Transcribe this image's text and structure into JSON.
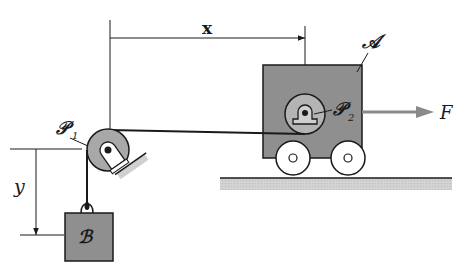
{
  "diagram": {
    "labels": {
      "x": "x",
      "y": "y",
      "force": "F",
      "cart": "𝒜",
      "block": "ℬ",
      "pulley1": "𝒫",
      "pulley1_sub": "1",
      "pulley2": "𝒫",
      "pulley2_sub": "2"
    },
    "colors": {
      "ink": "#1a1a1a",
      "cart_fill": "#8f8f8f",
      "pulley_fill": "#a8a8a8",
      "pulley2_fill": "#b4b4b4",
      "wheel_fill": "#ffffff",
      "ground_fill": "#c9c9c9",
      "force_arrow": "#8a8a8a",
      "block_fill": "#8f8f8f"
    }
  }
}
